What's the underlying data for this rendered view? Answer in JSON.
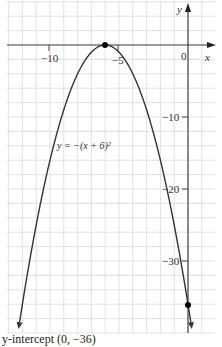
{
  "chart_data": {
    "type": "line",
    "title": "",
    "equation_label": "y = −(x + 6)²",
    "xlabel": "x",
    "ylabel": "y",
    "xlim": [
      -13,
      2
    ],
    "ylim": [
      -40,
      6
    ],
    "x_ticks": [
      {
        "value": -10,
        "label": "−10"
      },
      {
        "value": -5,
        "label": "−5"
      },
      {
        "value": 0,
        "label": "0"
      }
    ],
    "y_ticks": [
      {
        "value": -10,
        "label": "−10"
      },
      {
        "value": -20,
        "label": "−20"
      },
      {
        "value": -30,
        "label": "−30"
      }
    ],
    "grid": true,
    "grid_step_x": 1,
    "grid_step_y": 2,
    "series": [
      {
        "name": "y = −(x + 6)²",
        "function": "-(x+6)^2",
        "x": [
          -12.3,
          -12,
          -11,
          -10,
          -9,
          -8,
          -7,
          -6,
          -5,
          -4,
          -3,
          -2,
          -1,
          0,
          0.3
        ],
        "y": [
          -39.7,
          -36,
          -25,
          -16,
          -9,
          -4,
          -1,
          0,
          -1,
          -4,
          -9,
          -16,
          -25,
          -36,
          -39.7
        ],
        "color": "#333333"
      }
    ],
    "points": [
      {
        "name": "vertex",
        "x": -6,
        "y": 0
      },
      {
        "name": "y-intercept",
        "x": 0,
        "y": -36
      }
    ],
    "annotations": [
      {
        "text": "y-intercept (0, −36)",
        "position": "bottom-left"
      }
    ]
  },
  "labels": {
    "x_axis": "x",
    "y_axis": "y",
    "equation": "y = −(x + 6)²",
    "caption": "y-intercept (0, −36)",
    "tick_x_neg10": "−10",
    "tick_x_neg5": "−5",
    "tick_x_0": "0",
    "tick_y_neg10": "−10",
    "tick_y_neg20": "−20",
    "tick_y_neg30": "−30"
  },
  "colors": {
    "grid": "#d6d6d6",
    "axis": "#444444",
    "curve": "#333333",
    "point": "#000000"
  }
}
